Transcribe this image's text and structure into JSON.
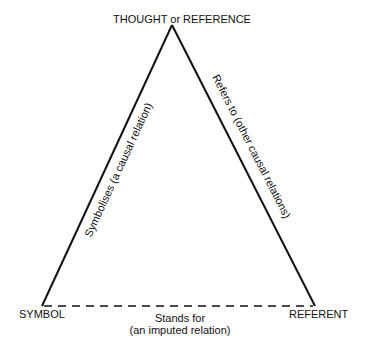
{
  "diagram": {
    "type": "semiotic-triangle",
    "nodes": {
      "top": {
        "label": "THOUGHT or REFERENCE"
      },
      "left": {
        "label": "SYMBOL"
      },
      "right": {
        "label": "REFERENT"
      }
    },
    "edges": {
      "left_side": {
        "label": "Symbolises (a causal relation)",
        "style": "solid"
      },
      "right_side": {
        "label": "Refers to (other causal relations)",
        "style": "solid"
      },
      "base": {
        "label_line1": "Stands for",
        "label_line2": "(an imputed relation)",
        "style": "dashed"
      }
    },
    "colors": {
      "line": "#111111",
      "background": "#ffffff"
    }
  }
}
